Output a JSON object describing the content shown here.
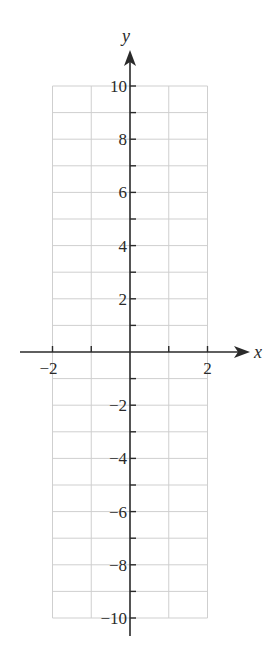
{
  "chart_data": {
    "type": "line",
    "title": "",
    "xlabel": "x",
    "ylabel": "y",
    "xlim": [
      -2,
      2
    ],
    "ylim": [
      -10,
      10
    ],
    "x_ticks": [
      -2,
      -1,
      0,
      1,
      2
    ],
    "x_tick_labels": [
      "−2",
      "2"
    ],
    "y_tick_labels": [
      "10",
      "8",
      "6",
      "4",
      "2",
      "−2",
      "−4",
      "−6",
      "−8",
      "−10"
    ],
    "y_tick_values": [
      10,
      8,
      6,
      4,
      2,
      -2,
      -4,
      -6,
      -8,
      -10
    ],
    "grid": true,
    "grid_x_step": 1,
    "grid_y_step": 1,
    "series": [],
    "colors": {
      "axis": "#2a2a2a",
      "grid": "#cfcfcf",
      "background": "#ffffff"
    }
  }
}
